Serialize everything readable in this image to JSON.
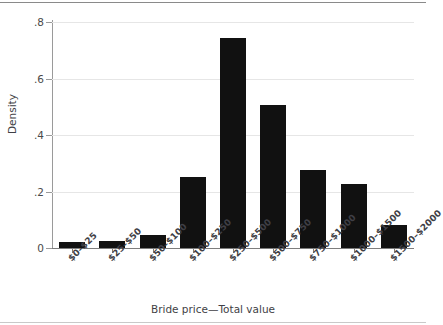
{
  "chart_data": {
    "type": "bar",
    "title": "",
    "xlabel": "Bride price—Total value",
    "ylabel": "Density",
    "categories": [
      "$0–$25",
      "$25–$50",
      "$50–$100",
      "$100–$250",
      "$250–$500",
      "$500–$750",
      "$750–$1000",
      "$1000–$1500",
      "$1500–$2000"
    ],
    "values": [
      0.02,
      0.025,
      0.045,
      0.25,
      0.745,
      0.505,
      0.275,
      0.225,
      0.08
    ],
    "ylim": [
      0,
      0.85
    ],
    "yticks": [
      0,
      0.2,
      0.4,
      0.6,
      0.8
    ],
    "ytick_labels": [
      "0",
      ".2",
      ".4",
      ".6",
      ".8"
    ],
    "grid": "horizontal",
    "legend": "none",
    "bar_color": "#111111",
    "grid_color": "#e6e6e6",
    "axis_color": "#7d7d7d",
    "text_color": "#3f3f46"
  }
}
